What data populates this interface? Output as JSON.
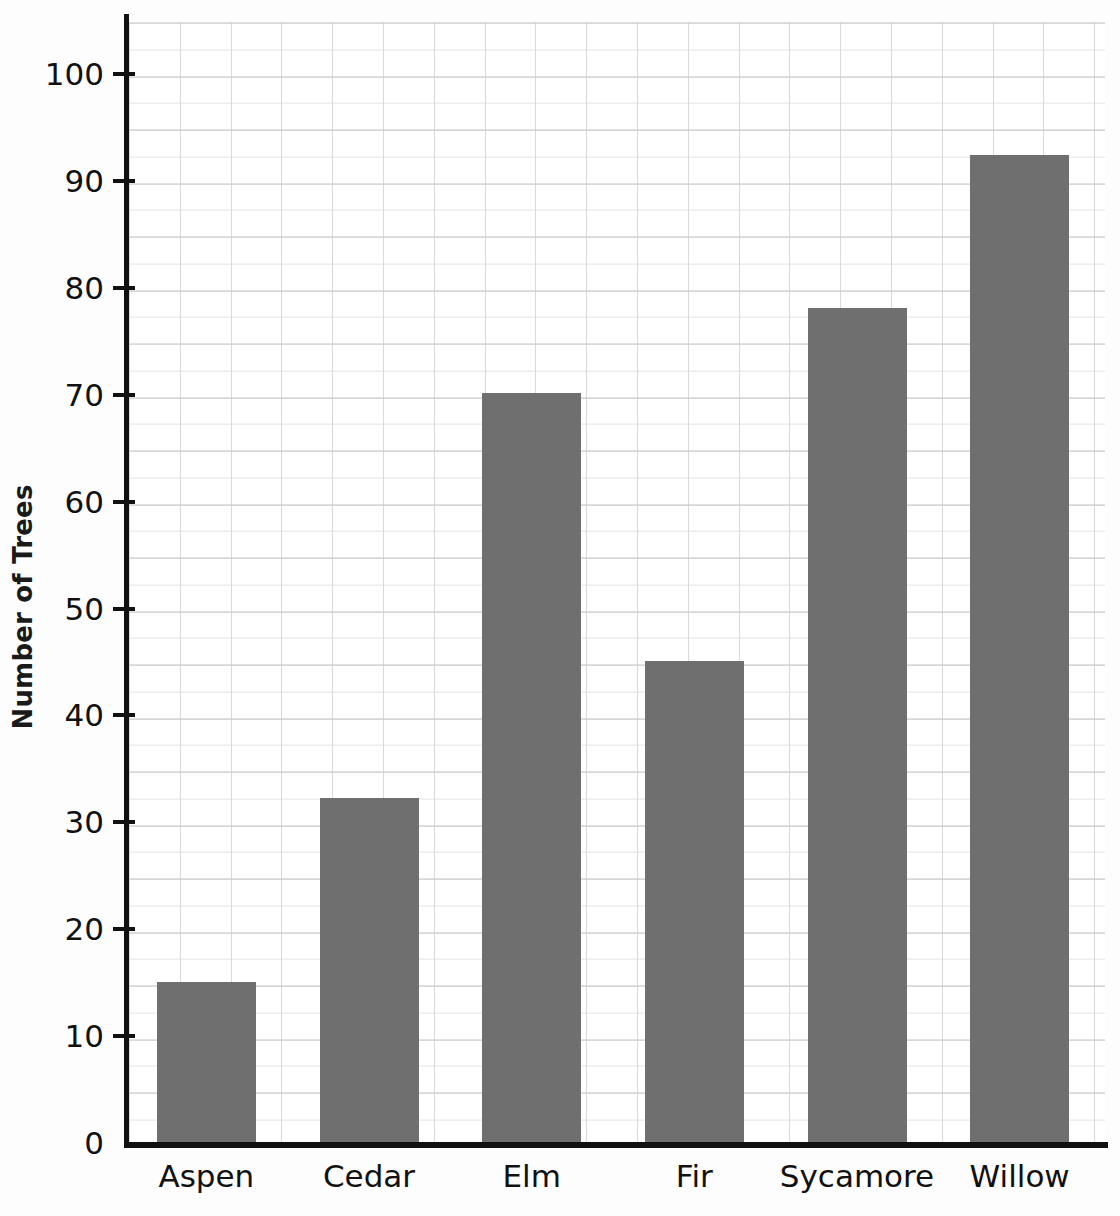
{
  "chart_data": {
    "type": "bar",
    "title": "",
    "subtitle": "",
    "xlabel": "",
    "ylabel": "Number of Trees",
    "categories": [
      "Aspen",
      "Cedar",
      "Elm",
      "Fir",
      "Sycamore",
      "Willow"
    ],
    "values": [
      15.1,
      32.3,
      70.2,
      45.1,
      78.1,
      92.4
    ],
    "ylim": [
      0,
      104
    ],
    "ytick_values": [
      0,
      10,
      20,
      30,
      40,
      50,
      60,
      70,
      80,
      90,
      100
    ],
    "ytick_labels": [
      "0",
      "10",
      "20",
      "30",
      "40",
      "50",
      "60",
      "70",
      "80",
      "90",
      "100"
    ],
    "grid": true,
    "grid_style": "graph-paper",
    "legend": false,
    "bar_color": "#6f6f6f",
    "axis_color": "#111111",
    "background_color": "#ffffff"
  }
}
